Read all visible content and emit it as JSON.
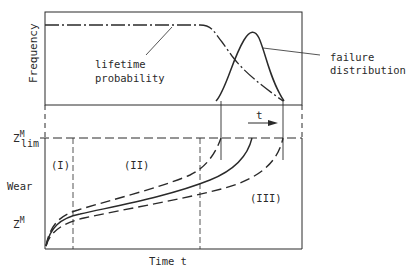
{
  "diagram": {
    "top_panel": {
      "y_axis_label": "Frequency",
      "curve_labels": {
        "lifetime": "lifetime\nprobability",
        "lifetime_line1": "lifetime",
        "lifetime_line2": "probability",
        "failure_line1": "failure",
        "failure_line2": "distribution"
      },
      "arrow_label": "t"
    },
    "bottom_panel": {
      "y_axis_label": "Wear",
      "x_axis_label": "Time t",
      "limit_label_main": "Z",
      "limit_label_sup": "M",
      "limit_label_sub": "lim",
      "value_label_main": "Z",
      "value_label_sup": "M",
      "phases": [
        "(I)",
        "(II)",
        "(III)"
      ]
    },
    "colors": {
      "line": "#2a2a2a",
      "background": "#ffffff"
    }
  }
}
